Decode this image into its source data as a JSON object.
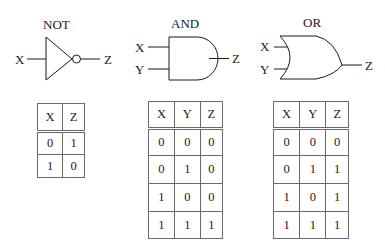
{
  "gates": {
    "not": {
      "title": "NOT",
      "inputs": [
        "X"
      ],
      "output": "Z",
      "truth_table": {
        "headers": [
          "X",
          "Z"
        ],
        "rows": [
          [
            "0",
            "1"
          ],
          [
            "1",
            "0"
          ]
        ]
      }
    },
    "and": {
      "title": "AND",
      "inputs": [
        "X",
        "Y"
      ],
      "output": "Z",
      "truth_table": {
        "headers": [
          "X",
          "Y",
          "Z"
        ],
        "rows": [
          [
            "0",
            "0",
            "0"
          ],
          [
            "0",
            "1",
            "0"
          ],
          [
            "1",
            "0",
            "0"
          ],
          [
            "1",
            "1",
            "1"
          ]
        ]
      }
    },
    "or": {
      "title": "OR",
      "inputs": [
        "X",
        "Y"
      ],
      "output": "Z",
      "truth_table": {
        "headers": [
          "X",
          "Y",
          "Z"
        ],
        "rows": [
          [
            "0",
            "0",
            "0"
          ],
          [
            "0",
            "1",
            "1"
          ],
          [
            "1",
            "0",
            "1"
          ],
          [
            "1",
            "1",
            "1"
          ]
        ]
      }
    }
  },
  "colors": {
    "line": "#1a1a1a",
    "table_border": "#6a6a6a",
    "background": "#ffffff"
  }
}
